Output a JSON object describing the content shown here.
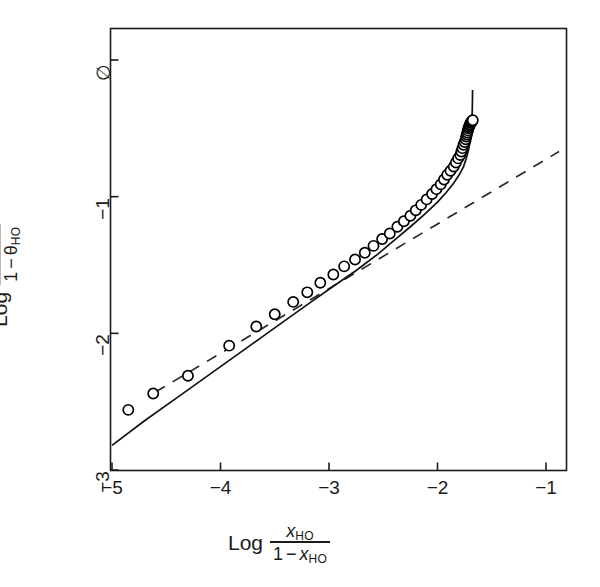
{
  "chart_data": {
    "type": "scatter",
    "title": "",
    "xlabel": "Log x_HO / (1 - x_HO)",
    "ylabel": "Log θ_HO / (1 - θ_HO)",
    "xlim": [
      -5.0,
      -0.75
    ],
    "ylim": [
      -3.0,
      0.25
    ],
    "xticks": [
      -5,
      -4,
      -3,
      -2,
      -1
    ],
    "xticklabels": [
      "−5",
      "−4",
      "−3",
      "−2",
      "−1"
    ],
    "yticks": [
      0,
      -1,
      -2,
      -3
    ],
    "yticklabels": [
      "∅",
      "−1",
      "−2",
      "−3"
    ],
    "grid": false,
    "legend": null,
    "legend_position": "none",
    "series": [
      {
        "name": "data-points",
        "marker": "open-circle",
        "marker_color": "#000000",
        "x": [
          -4.85,
          -4.62,
          -4.3,
          -3.92,
          -3.67,
          -3.5,
          -3.33,
          -3.2,
          -3.08,
          -2.96,
          -2.86,
          -2.76,
          -2.67,
          -2.59,
          -2.51,
          -2.44,
          -2.37,
          -2.31,
          -2.25,
          -2.2,
          -2.15,
          -2.1,
          -2.05,
          -2.01,
          -1.97,
          -1.94,
          -1.91,
          -1.88,
          -1.85,
          -1.83,
          -1.81,
          -1.79,
          -1.78,
          -1.77,
          -1.76,
          -1.75,
          -1.74,
          -1.735,
          -1.73,
          -1.725,
          -1.72,
          -1.715,
          -1.71,
          -1.705,
          -1.7,
          -1.695,
          -1.69,
          -1.685,
          -1.68,
          -1.675
        ],
        "y": [
          -2.56,
          -2.44,
          -2.31,
          -2.09,
          -1.95,
          -1.86,
          -1.77,
          -1.7,
          -1.63,
          -1.57,
          -1.51,
          -1.46,
          -1.41,
          -1.36,
          -1.31,
          -1.27,
          -1.22,
          -1.18,
          -1.14,
          -1.1,
          -1.06,
          -1.02,
          -0.98,
          -0.945,
          -0.91,
          -0.875,
          -0.84,
          -0.81,
          -0.78,
          -0.75,
          -0.72,
          -0.695,
          -0.67,
          -0.645,
          -0.62,
          -0.6,
          -0.58,
          -0.56,
          -0.545,
          -0.53,
          -0.515,
          -0.5,
          -0.49,
          -0.48,
          -0.47,
          -0.46,
          -0.455,
          -0.45,
          -0.445,
          -0.44
        ]
      },
      {
        "name": "model-curve-solid",
        "style": "solid",
        "color": "#000000",
        "x": [
          -5.0,
          -4.7,
          -4.4,
          -4.1,
          -3.8,
          -3.5,
          -3.2,
          -2.95,
          -2.75,
          -2.55,
          -2.4,
          -2.25,
          -2.12,
          -2.0,
          -1.92,
          -1.85,
          -1.8,
          -1.76,
          -1.735,
          -1.715,
          -1.7,
          -1.69,
          -1.685,
          -1.68,
          -1.678,
          -1.677
        ],
        "y": [
          -2.82,
          -2.64,
          -2.47,
          -2.3,
          -2.13,
          -1.96,
          -1.79,
          -1.65,
          -1.54,
          -1.42,
          -1.32,
          -1.22,
          -1.13,
          -1.04,
          -0.97,
          -0.9,
          -0.84,
          -0.78,
          -0.72,
          -0.66,
          -0.6,
          -0.53,
          -0.46,
          -0.38,
          -0.3,
          -0.22
        ]
      },
      {
        "name": "reference-line-dashed",
        "style": "dashed",
        "color": "#000000",
        "x": [
          -4.6,
          -0.88
        ],
        "y": [
          -2.43,
          -0.67
        ]
      }
    ]
  },
  "axes": {
    "x_title": {
      "lead": "Log",
      "numerator_main": "x",
      "numerator_sub": "HO",
      "denominator_one": "1",
      "denominator_minus": "−",
      "denominator_main": "x",
      "denominator_sub": "HO"
    },
    "y_title": {
      "lead": "Log",
      "numerator_main": "θ",
      "numerator_sub": "HO",
      "denominator_one": "1",
      "denominator_minus": "−",
      "denominator_main": "θ",
      "denominator_sub": "HO"
    }
  },
  "style": {
    "frame_color": "#1b1b1b",
    "background": "#ffffff",
    "marker_fill": "#ffffff"
  }
}
